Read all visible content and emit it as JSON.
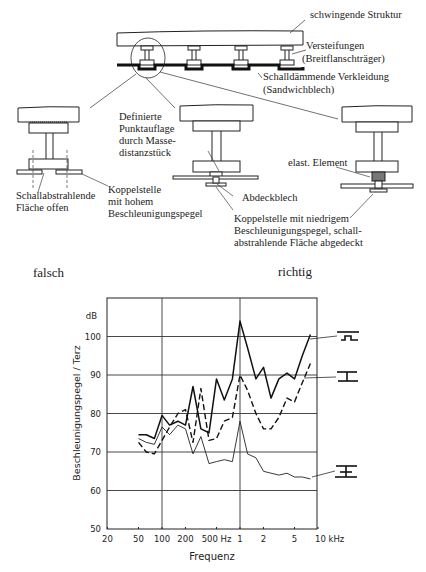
{
  "diagram": {
    "labels": {
      "structure": "schwingende Struktur",
      "stiffeners_1": "Versteifungen",
      "stiffeners_2": "(Breitflanschträger)",
      "cladding_1": "Schalldämmende Verkleidung",
      "cladding_2": "(Sandwichblech)",
      "open_surface_1": "Schallabstrahlende",
      "open_surface_2": "Fläche  offen",
      "coupling_high_1": "Koppelstelle",
      "coupling_high_2": "mit hohem",
      "coupling_high_3": "Beschleunigungspegel",
      "point_support_1": "Definierte",
      "point_support_2": "Punktauflage",
      "point_support_3": "durch Masse-",
      "point_support_4": "distanzstück",
      "cover_sheet": "Abdeckblech",
      "elastic_element": "elast. Element",
      "coupling_low_1": "Koppelstelle mit niedrigem",
      "coupling_low_2": "Beschleunigungspegel, schall-",
      "coupling_low_3": "abstrahlende Fläche abgedeckt",
      "wrong": "falsch",
      "right": "richtig"
    }
  },
  "chart_data": {
    "type": "line",
    "title": "",
    "xlabel": "Frequenz",
    "ylabel": "Beschleunigungspegel / Terz",
    "y_unit": "dB",
    "x_scale": "log",
    "xlim": [
      20,
      10000
    ],
    "ylim": [
      50,
      110
    ],
    "grid": true,
    "x_ticks": [
      {
        "value": 20,
        "label": "20"
      },
      {
        "value": 50,
        "label": "50"
      },
      {
        "value": 100,
        "label": "100"
      },
      {
        "value": 200,
        "label": "200"
      },
      {
        "value": 500,
        "label": "500 Hz"
      },
      {
        "value": 1000,
        "label": "1"
      },
      {
        "value": 2000,
        "label": "2"
      },
      {
        "value": 5000,
        "label": "5"
      },
      {
        "value": 10000,
        "label": "10 kHz"
      }
    ],
    "y_ticks": [
      {
        "value": 50,
        "label": "50"
      },
      {
        "value": 60,
        "label": "60"
      },
      {
        "value": 70,
        "label": "70"
      },
      {
        "value": 80,
        "label": "80"
      },
      {
        "value": 90,
        "label": "90"
      },
      {
        "value": 100,
        "label": "100"
      }
    ],
    "x": [
      50,
      63,
      80,
      100,
      125,
      160,
      200,
      250,
      315,
      400,
      500,
      630,
      800,
      1000,
      1250,
      1600,
      2000,
      2500,
      3150,
      4000,
      5000,
      6300,
      8000
    ],
    "series": [
      {
        "name": "offen (falsch)",
        "style": "solid-thick",
        "values": [
          74.5,
          74.5,
          73.5,
          79.5,
          77,
          78,
          77,
          87,
          76,
          75,
          89,
          83.5,
          89,
          104,
          97,
          89,
          92,
          84,
          89,
          90.5,
          89,
          95,
          100.5
        ]
      },
      {
        "name": "Abdeckblech",
        "style": "dashed",
        "values": [
          72.5,
          70,
          69.5,
          73,
          76.5,
          80,
          81,
          72.5,
          86.5,
          73,
          73.5,
          78,
          79,
          90,
          86,
          80,
          76,
          76,
          79,
          84,
          83,
          88,
          93
        ]
      },
      {
        "name": "elast. Element",
        "style": "solid-thin",
        "values": [
          73.5,
          72.5,
          72,
          76.5,
          74.5,
          77,
          76,
          69.5,
          74,
          67,
          67.5,
          68,
          67.5,
          78,
          69.5,
          68.5,
          65,
          64.5,
          64,
          64.5,
          63.5,
          63.5,
          63
        ]
      }
    ],
    "legend": "glyphs at right of curves (profile symbols)"
  }
}
